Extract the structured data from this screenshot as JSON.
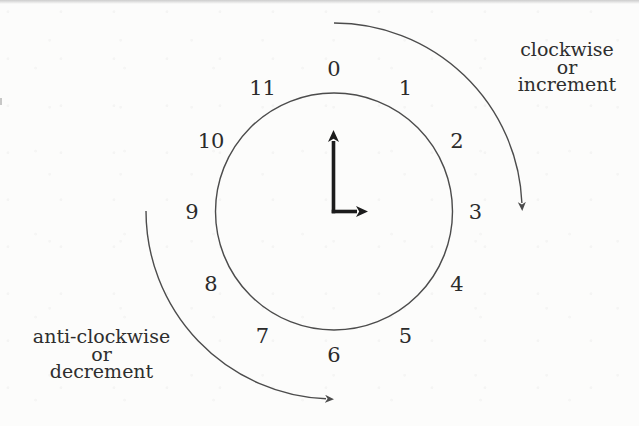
{
  "diagram": {
    "clock_numbers": [
      "0",
      "1",
      "2",
      "3",
      "4",
      "5",
      "6",
      "7",
      "8",
      "9",
      "10",
      "11"
    ],
    "hands": {
      "long_hand_points_to": "0",
      "short_hand_points_to": "3"
    },
    "labels": {
      "clockwise": {
        "lines": [
          "clockwise",
          "or",
          "increment"
        ]
      },
      "anticlockwise": {
        "lines": [
          "anti-clockwise",
          "or",
          "decrement"
        ]
      }
    },
    "colors": {
      "ink": "#2b2b2b",
      "line": "#4c4c4c",
      "hand": "#1c1c1c",
      "paper": "#fcfcfb"
    }
  }
}
